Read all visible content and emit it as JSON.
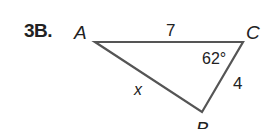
{
  "problem": {
    "label": "3B."
  },
  "triangle": {
    "vertices": {
      "A": {
        "label": "A",
        "x": 95,
        "y": 42
      },
      "C": {
        "label": "C",
        "x": 243,
        "y": 42
      },
      "B": {
        "label": "B",
        "x": 202,
        "y": 112
      }
    },
    "sides": {
      "AC": {
        "label": "7"
      },
      "CB": {
        "label": "4"
      },
      "AB": {
        "label": "x"
      }
    },
    "angles": {
      "C": {
        "label": "62°"
      }
    },
    "stroke_color": "#555555",
    "text_color": "#222222"
  }
}
